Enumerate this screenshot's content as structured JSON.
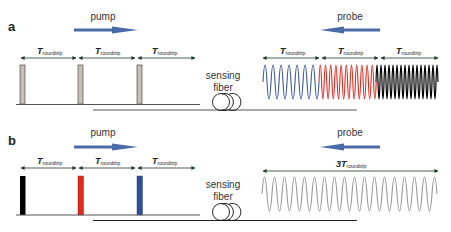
{
  "panels": [
    {
      "label": "a",
      "pump_label": "pump",
      "probe_label": "probe",
      "fiber_label_line1": "sensing",
      "fiber_label_line2": "fiber",
      "pump_intervals": [
        {
          "main": "T",
          "sub": "roundtrip"
        },
        {
          "main": "T",
          "sub": "roundtrip"
        },
        {
          "main": "T",
          "sub": "roundtrip"
        }
      ],
      "probe_intervals": [
        {
          "main": "T",
          "sub": "roundtrip"
        },
        {
          "main": "T",
          "sub": "roundtrip"
        },
        {
          "main": "T",
          "sub": "roundtrip"
        }
      ],
      "pump_pulse_colors": [
        "#c8c0b8",
        "#c8c0b8",
        "#c8c0b8"
      ],
      "probe_wave_colors": [
        "#3a5a9a",
        "#e02a1e",
        "#000000"
      ]
    },
    {
      "label": "b",
      "pump_label": "pump",
      "probe_label": "probe",
      "fiber_label_line1": "sensing",
      "fiber_label_line2": "fiber",
      "pump_intervals": [
        {
          "main": "T",
          "sub": "roundtrip"
        },
        {
          "main": "T",
          "sub": "roundtrip"
        },
        {
          "main": "T",
          "sub": "roundtrip"
        }
      ],
      "probe_interval": {
        "prefix": "3",
        "main": "T",
        "sub": "roundtrip"
      },
      "pump_pulse_colors": [
        "#000000",
        "#e02a1e",
        "#2f4f9a"
      ],
      "probe_wave_color": "#999999"
    }
  ],
  "colors": {
    "arrow_blue": "#4a6aa8",
    "interval_arrow": "#1f4a2a",
    "baseline": "#444444"
  }
}
